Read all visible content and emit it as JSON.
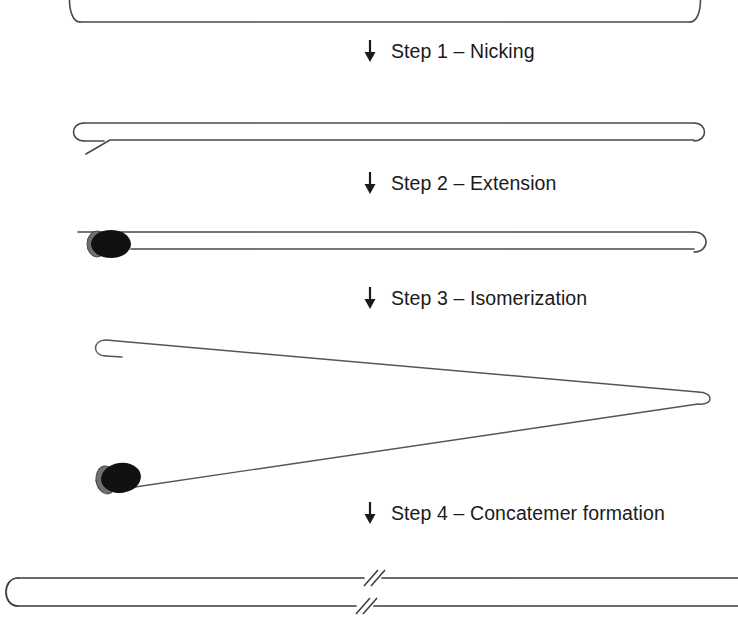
{
  "figure": {
    "background_color": "#ffffff",
    "strand_color": "#4a4a4a",
    "enzyme_body_color": "#111111",
    "enzyme_cap_color": "#6f6f6f",
    "text_color": "#1a1a1a"
  },
  "steps": [
    {
      "id": "step-1",
      "arrow": "down-arrow-icon",
      "label": "Step 1 – Nicking",
      "number": "1",
      "name": "Nicking"
    },
    {
      "id": "step-2",
      "arrow": "down-arrow-icon",
      "label": "Step 2 –  Extension",
      "number": "2",
      "name": "Extension"
    },
    {
      "id": "step-3",
      "arrow": "down-arrow-icon",
      "label": "Step 3 –  Isomerization",
      "number": "3",
      "name": "Isomerization"
    },
    {
      "id": "step-4",
      "arrow": "down-arrow-icon",
      "label": "Step 4 –  Concatemer formation",
      "number": "4",
      "name": "Concatemer formation"
    }
  ],
  "structures": [
    {
      "id": "structure-0",
      "name": "dumbbell-template",
      "description": "Closed dumbbell DNA template with rounded hairpin caps at both ends, clipped by the top edge of the figure."
    },
    {
      "id": "structure-1",
      "name": "nicked-dumbbell",
      "description": "Dumbbell after nicking: the bottom strand near the left hairpin is cut, leaving a short free end angled down to the left."
    },
    {
      "id": "structure-2",
      "name": "extended-dumbbell-with-polymerase",
      "description": "Polymerase bound at the nick on the left extends the strand along the duplex toward the right hairpin cap."
    },
    {
      "id": "structure-3",
      "name": "isomerized-structure",
      "description": "Isomerized open structure forming a long narrow triangle with the apex at the right; a small hairpin cap at the upper left and a polymerase on the lower strand at the left."
    },
    {
      "id": "structure-4",
      "name": "concatemer",
      "description": "Long double-stranded concatemer product with a rounded cap at the left, double-slash break marks in the middle, and strands running off the right edge."
    }
  ],
  "annotations": {
    "break_mark": "double-slash-break-icon",
    "polymerase": "polymerase-enzyme-icon",
    "hairpin_cap": "hairpin-loop-cap"
  }
}
